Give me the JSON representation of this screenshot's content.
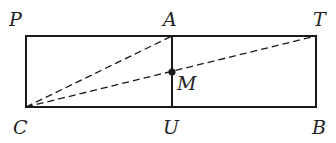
{
  "diagram": {
    "type": "geometry",
    "colors": {
      "stroke": "#1a1a1a",
      "label": "#222222",
      "background": "#ffffff"
    },
    "points": {
      "P": {
        "label": "P",
        "x": 26,
        "y": 36
      },
      "A": {
        "label": "A",
        "x": 172,
        "y": 36
      },
      "T": {
        "label": "T",
        "x": 316,
        "y": 36
      },
      "C": {
        "label": "C",
        "x": 26,
        "y": 107
      },
      "U": {
        "label": "U",
        "x": 172,
        "y": 107
      },
      "B": {
        "label": "B",
        "x": 316,
        "y": 107
      },
      "M": {
        "label": "M",
        "x": 172,
        "y": 72
      }
    },
    "segments": [
      {
        "from": "P",
        "to": "T",
        "style": "solid"
      },
      {
        "from": "T",
        "to": "B",
        "style": "solid"
      },
      {
        "from": "B",
        "to": "C",
        "style": "solid"
      },
      {
        "from": "C",
        "to": "P",
        "style": "solid"
      },
      {
        "from": "A",
        "to": "U",
        "style": "solid"
      },
      {
        "from": "C",
        "to": "A",
        "style": "dashed"
      },
      {
        "from": "C",
        "to": "T",
        "style": "dashed"
      }
    ],
    "labels": {
      "P": "P",
      "A": "A",
      "T": "T",
      "C": "C",
      "U": "U",
      "B": "B",
      "M": "M"
    }
  }
}
